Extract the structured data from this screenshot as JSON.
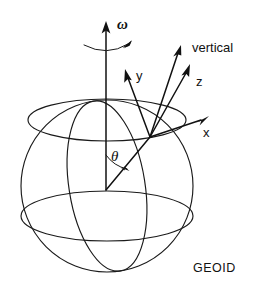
{
  "figure": {
    "name": "geoid-rotation-coordinate-diagram",
    "background_color": "#ffffff",
    "ink_color": "#111111"
  },
  "labels": {
    "omega": "ω",
    "theta": "θ",
    "axis_y": "y",
    "axis_z": "z",
    "axis_x": "x",
    "vertical": "vertical",
    "geoid": "GEOID"
  },
  "geometry": {
    "sphere": {
      "cx": 107,
      "cy": 186,
      "r": 86
    },
    "origin": {
      "x": 106,
      "y": 190
    },
    "surface_point": {
      "x": 150,
      "y": 137
    },
    "polar_axis_tip": {
      "x": 106,
      "y": 24
    },
    "vertical_tip": {
      "x": 181,
      "y": 47
    },
    "y_tip": {
      "x": 126,
      "y": 71
    },
    "z_tip": {
      "x": 190,
      "y": 66
    },
    "x_tip": {
      "x": 208,
      "y": 117
    }
  }
}
